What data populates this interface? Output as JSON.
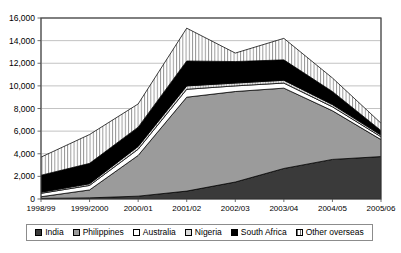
{
  "chart_data": {
    "type": "area",
    "stacked": true,
    "title": "",
    "subtitle": "",
    "xlabel": "",
    "ylabel": "",
    "grid": true,
    "legend_position": "bottom",
    "categories": [
      "1998/99",
      "1999/2000",
      "2000/01",
      "2001/02",
      "2002/03",
      "2003/04",
      "2004/05",
      "2005/06"
    ],
    "ylim": [
      0,
      16000
    ],
    "yticks": [
      0,
      2000,
      4000,
      6000,
      8000,
      10000,
      12000,
      14000,
      16000
    ],
    "ytick_labels": [
      "0",
      "2,000",
      "4,000",
      "6,000",
      "8,000",
      "10,000",
      "12,000",
      "14,000",
      "16,000"
    ],
    "series": [
      {
        "name": "India",
        "color": "#3a3a3a",
        "pattern": "solid-dark",
        "values": [
          50,
          100,
          250,
          700,
          1500,
          2700,
          3500,
          3750
        ]
      },
      {
        "name": "Philippines",
        "color": "#9b9b9b",
        "pattern": "solid-mid-grey",
        "values": [
          150,
          700,
          3600,
          8300,
          8000,
          7100,
          4300,
          1500
        ]
      },
      {
        "name": "Australia",
        "color": "#ffffff",
        "pattern": "solid-white",
        "values": [
          300,
          400,
          550,
          700,
          500,
          450,
          350,
          250
        ]
      },
      {
        "name": "Nigeria",
        "color": "#d9d9d9",
        "pattern": "light-grey-hatch",
        "values": [
          100,
          150,
          250,
          300,
          250,
          250,
          200,
          150
        ]
      },
      {
        "name": "South Africa",
        "color": "#000000",
        "pattern": "solid-black",
        "values": [
          1500,
          1800,
          1700,
          2200,
          1900,
          1800,
          1150,
          400
        ]
      },
      {
        "name": "Other overseas",
        "color": "#ffffff",
        "pattern": "vertical-hatch",
        "values": [
          1600,
          2550,
          2050,
          2900,
          750,
          1900,
          1200,
          650
        ]
      }
    ],
    "totals": [
      3700,
      5700,
      8400,
      15100,
      12900,
      14200,
      10700,
      6700
    ]
  },
  "legend": {
    "items": [
      {
        "label": "India",
        "swatch": "solid-dark"
      },
      {
        "label": "Philippines",
        "swatch": "solid-mid-grey"
      },
      {
        "label": "Australia",
        "swatch": "solid-white"
      },
      {
        "label": "Nigeria",
        "swatch": "light-grey-hatch"
      },
      {
        "label": "South Africa",
        "swatch": "solid-black"
      },
      {
        "label": "Other overseas",
        "swatch": "vertical-hatch"
      }
    ]
  },
  "colors": {
    "india": "#3a3a3a",
    "philippines": "#9b9b9b",
    "australia": "#ffffff",
    "nigeria": "#d9d9d9",
    "south_africa": "#000000",
    "other_overseas": "#ffffff",
    "grid": "#9a9a9a",
    "axis": "#4a4a4a",
    "background": "#ffffff"
  }
}
